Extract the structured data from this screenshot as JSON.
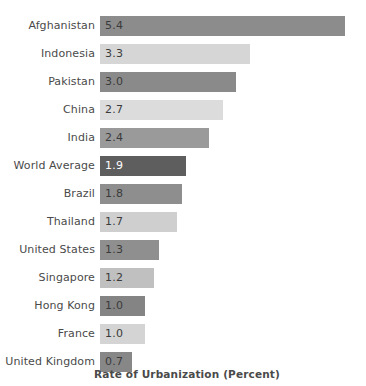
{
  "chart_data": {
    "type": "bar",
    "orientation": "horizontal",
    "title": "",
    "xlabel": "Rate of Urbanization (Percent)",
    "ylabel": "",
    "xlim": [
      0,
      5.4
    ],
    "grid": false,
    "legend": null,
    "categories": [
      "Afghanistan",
      "Indonesia",
      "Pakistan",
      "China",
      "India",
      "World Average",
      "Brazil",
      "Thailand",
      "United States",
      "Singapore",
      "Hong Kong",
      "France",
      "United Kingdom"
    ],
    "values": [
      5.4,
      3.3,
      3.0,
      2.7,
      2.4,
      1.9,
      1.8,
      1.7,
      1.3,
      1.2,
      1.0,
      1.0,
      0.7
    ],
    "value_labels": [
      "5.4",
      "3.3",
      "3.0",
      "2.7",
      "2.4",
      "1.9",
      "1.8",
      "1.7",
      "1.3",
      "1.2",
      "1.0",
      "1.0",
      "0.7"
    ],
    "bar_colors": [
      "#8c8c8c",
      "#d6d6d6",
      "#8a8a8a",
      "#dcdcdc",
      "#9a9a9a",
      "#5e5e5e",
      "#8e8e8e",
      "#cfcfcf",
      "#8f8f8f",
      "#c0c0c0",
      "#848484",
      "#d4d4d4",
      "#878787"
    ],
    "value_label_colors": [
      "#3b3b3b",
      "#3b3b3b",
      "#3b3b3b",
      "#3b3b3b",
      "#3b3b3b",
      "#ffffff",
      "#3b3b3b",
      "#3b3b3b",
      "#3b3b3b",
      "#3b3b3b",
      "#3b3b3b",
      "#3b3b3b",
      "#3b3b3b"
    ],
    "category_label_color": "#4a4a4a",
    "axis_title_color": "#4a4a4a",
    "background_color": "#ffffff"
  }
}
